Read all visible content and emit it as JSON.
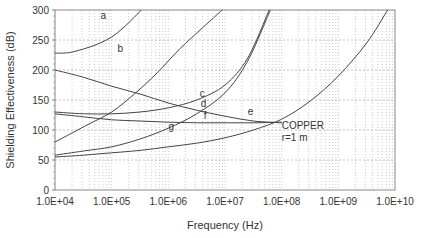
{
  "chart_data": {
    "type": "line",
    "title": "",
    "xlabel": "Frequency (Hz)",
    "ylabel": "Shielding Effectiveness (dB)",
    "xscale": "log",
    "xlim": [
      10000,
      10000000000
    ],
    "ylim": [
      0,
      300
    ],
    "grid": true,
    "x_tick_labels": [
      "1.0E+04",
      "1.0E+05",
      "1.0E+06",
      "1.0E+07",
      "1.0E+08",
      "1.0E+09",
      "1.0E+10"
    ],
    "y_tick_labels": [
      "0",
      "50",
      "100",
      "150",
      "200",
      "250",
      "300"
    ],
    "annotations": [
      {
        "text": "COPPER",
        "x_log10": 8.0,
        "y": 102
      },
      {
        "text": "r=1 m",
        "x_log10": 8.0,
        "y": 82
      }
    ],
    "series": [
      {
        "name": "a",
        "label_pos": [
          4.85,
          285
        ],
        "points_log10x": [
          [
            4.0,
            228
          ],
          [
            4.25,
            229
          ],
          [
            4.5,
            235
          ],
          [
            4.75,
            243
          ],
          [
            5.0,
            255
          ],
          [
            5.2,
            270
          ],
          [
            5.4,
            288
          ],
          [
            5.52,
            300
          ]
        ]
      },
      {
        "name": "b",
        "label_pos": [
          5.15,
          230
        ],
        "points_log10x": [
          [
            4.0,
            80
          ],
          [
            4.3,
            95
          ],
          [
            4.6,
            110
          ],
          [
            5.0,
            130
          ],
          [
            5.4,
            160
          ],
          [
            5.8,
            195
          ],
          [
            6.2,
            235
          ],
          [
            6.6,
            270
          ],
          [
            6.95,
            300
          ]
        ]
      },
      {
        "name": "c",
        "label_pos": [
          6.6,
          155
        ],
        "points_log10x": [
          [
            4.0,
            130
          ],
          [
            4.5,
            127
          ],
          [
            5.0,
            127
          ],
          [
            5.5,
            130
          ],
          [
            6.0,
            137
          ],
          [
            6.5,
            150
          ],
          [
            7.0,
            175
          ],
          [
            7.4,
            220
          ],
          [
            7.78,
            300
          ]
        ]
      },
      {
        "name": "d",
        "label_pos": [
          6.62,
          138
        ],
        "points_log10x": [
          [
            4.0,
            58
          ],
          [
            4.5,
            65
          ],
          [
            5.0,
            72
          ],
          [
            5.5,
            85
          ],
          [
            6.0,
            103
          ],
          [
            6.5,
            127
          ],
          [
            7.0,
            162
          ],
          [
            7.4,
            215
          ],
          [
            7.8,
            300
          ]
        ]
      },
      {
        "name": "e",
        "label_pos": [
          7.45,
          125
        ],
        "points_log10x": [
          [
            4.0,
            200
          ],
          [
            4.5,
            188
          ],
          [
            5.0,
            173
          ],
          [
            5.5,
            160
          ],
          [
            6.0,
            145
          ],
          [
            6.5,
            133
          ],
          [
            7.0,
            123
          ],
          [
            7.5,
            115
          ],
          [
            8.0,
            112
          ]
        ]
      },
      {
        "name": "f",
        "label_pos": [
          6.65,
          118
        ],
        "points_log10x": [
          [
            4.0,
            127
          ],
          [
            4.5,
            122
          ],
          [
            5.0,
            117
          ],
          [
            5.5,
            115
          ],
          [
            6.0,
            113
          ],
          [
            6.5,
            112
          ],
          [
            7.0,
            112
          ],
          [
            7.5,
            112
          ],
          [
            8.0,
            113
          ]
        ]
      },
      {
        "name": "g",
        "label_pos": [
          6.05,
          100
        ],
        "points_log10x": [
          [
            4.0,
            55
          ],
          [
            4.5,
            58
          ],
          [
            5.0,
            62
          ],
          [
            5.5,
            66
          ],
          [
            6.0,
            72
          ],
          [
            6.5,
            78
          ],
          [
            7.0,
            87
          ],
          [
            7.5,
            100
          ],
          [
            8.0,
            118
          ],
          [
            8.5,
            148
          ],
          [
            9.0,
            190
          ],
          [
            9.5,
            245
          ],
          [
            9.87,
            300
          ]
        ]
      }
    ]
  }
}
